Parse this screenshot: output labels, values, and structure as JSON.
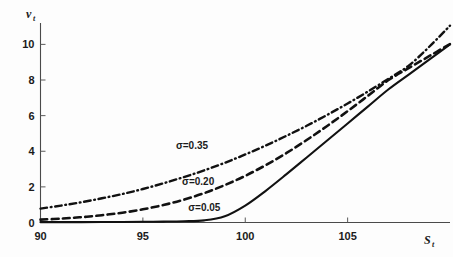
{
  "chart_data": {
    "type": "line",
    "title": "",
    "subtitle": "",
    "xlabel": "S_t",
    "ylabel": "v_t",
    "xlabel_base": "S",
    "xlabel_sub": "t",
    "ylabel_base": "v",
    "ylabel_sub": "t",
    "xlim": [
      90,
      110
    ],
    "ylim": [
      0,
      11.2
    ],
    "xticks": [
      90,
      95,
      100,
      105
    ],
    "xtick_labels": [
      "90",
      "95",
      "100",
      "105"
    ],
    "yticks": [
      0,
      2,
      4,
      6,
      8,
      10
    ],
    "ytick_labels": [
      "0",
      "2",
      "4",
      "6",
      "8",
      "10"
    ],
    "grid": false,
    "legend_position": "inline-annotations",
    "x": [
      90,
      91,
      92,
      93,
      94,
      95,
      96,
      97,
      98,
      99,
      100,
      101,
      102,
      103,
      104,
      105,
      106,
      107,
      108,
      109,
      110
    ],
    "series": [
      {
        "name": "sigma=0.35",
        "label": "σ=0.35",
        "linestyle": "dashdot",
        "color": "#111111",
        "linewidth": 2.4,
        "values": [
          0.78,
          0.95,
          1.14,
          1.36,
          1.6,
          1.88,
          2.2,
          2.55,
          2.93,
          3.35,
          3.82,
          4.32,
          4.86,
          5.43,
          6.04,
          6.68,
          7.36,
          8.07,
          8.82,
          9.88,
          11.05
        ],
        "annotation": {
          "text": "σ=0.35",
          "x": 97.4,
          "y": 4.15
        }
      },
      {
        "name": "sigma=0.20",
        "label": "σ=0.20",
        "linestyle": "dashed",
        "color": "#111111",
        "linewidth": 2.6,
        "values": [
          0.16,
          0.22,
          0.3,
          0.41,
          0.55,
          0.74,
          0.98,
          1.28,
          1.65,
          2.1,
          2.62,
          3.22,
          3.89,
          4.63,
          5.42,
          6.25,
          7.12,
          8.0,
          8.68,
          9.35,
          10.02
        ],
        "annotation": {
          "text": "σ=0.20",
          "x": 97.7,
          "y": 2.12
        }
      },
      {
        "name": "sigma=0.05",
        "label": "σ=0.05",
        "linestyle": "solid",
        "color": "#111111",
        "linewidth": 2.1,
        "values": [
          0.02,
          0.02,
          0.02,
          0.03,
          0.03,
          0.04,
          0.05,
          0.07,
          0.12,
          0.35,
          0.95,
          1.78,
          2.7,
          3.65,
          4.6,
          5.56,
          6.52,
          7.48,
          8.32,
          9.16,
          10.0
        ],
        "annotation": {
          "text": "σ=0.05",
          "x": 98.0,
          "y": 0.62
        }
      }
    ]
  }
}
